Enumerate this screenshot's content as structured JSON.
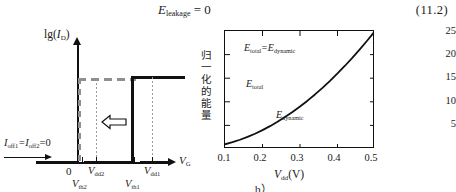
{
  "equation": {
    "lhs": "E",
    "lhs_sub": "leakage",
    "rel": " = 0",
    "number": "(11.2)"
  },
  "figure_a": {
    "caption": "a）",
    "y_axis_label": "lg(",
    "y_axis_label_var": "I",
    "y_axis_label_sub": "D",
    "y_axis_label_end": ")",
    "x_axis_label": "V",
    "x_axis_label_sub": "G",
    "origin_label": "0",
    "leakage_note": "I",
    "leakage_sub1": "off1",
    "leakage_mid": "=I",
    "leakage_sub2": "off2",
    "leakage_end": "=0",
    "markers": [
      {
        "name": "vdd2",
        "label": "V",
        "sub": "dd2"
      },
      {
        "name": "vth2",
        "label": "V",
        "sub": "th2"
      },
      {
        "name": "vdd1",
        "label": "V",
        "sub": "dd1"
      },
      {
        "name": "vth1",
        "label": "V",
        "sub": "th1"
      }
    ],
    "arrow_icon": "left-block-arrow",
    "curves": [
      {
        "name": "low-vth-device",
        "style": "dashed",
        "color": "#8f8f8f"
      },
      {
        "name": "high-vth-device",
        "style": "solid",
        "color": "#111111"
      }
    ]
  },
  "chart_data": {
    "type": "line",
    "title": "",
    "caption": "b）",
    "xlabel": "V",
    "xlabel_sub": "dd",
    "xlabel_unit": "(V)",
    "ylabel": "归一化的能量",
    "xlim": [
      0.1,
      0.5
    ],
    "ylim": [
      0,
      25
    ],
    "xticks": [
      "0.1",
      "0.2",
      "0.3",
      "0.4",
      "0.5"
    ],
    "xtick_values": [
      0.1,
      0.2,
      0.3,
      0.4,
      0.5
    ],
    "yticks": [
      "5",
      "10",
      "15",
      "20",
      "25"
    ],
    "ytick_values": [
      5,
      10,
      15,
      20,
      25
    ],
    "grid": false,
    "legend": "none",
    "series": [
      {
        "name": "E_total = E_dynamic",
        "color": "#111111",
        "x": [
          0.1,
          0.12,
          0.14,
          0.16,
          0.18,
          0.2,
          0.22,
          0.24,
          0.26,
          0.28,
          0.3,
          0.32,
          0.34,
          0.36,
          0.38,
          0.4,
          0.42,
          0.44,
          0.46,
          0.48,
          0.5
        ],
        "y": [
          1.0,
          1.44,
          1.96,
          2.56,
          3.24,
          4.0,
          4.84,
          5.76,
          6.76,
          7.84,
          9.0,
          10.24,
          11.56,
          12.96,
          14.44,
          16.0,
          17.64,
          19.36,
          21.16,
          23.04,
          25.0
        ]
      }
    ],
    "annotations": [
      {
        "name": "etotal-equals-edynamic",
        "text": "E",
        "sub": "total",
        "mid": "=E",
        "sub2": "dynamic"
      },
      {
        "name": "etotal",
        "text": "E",
        "sub": "total"
      },
      {
        "name": "edynamic",
        "text": "E",
        "sub": "dynamic"
      }
    ]
  }
}
